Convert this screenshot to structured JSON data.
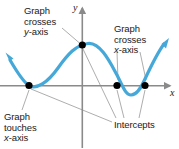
{
  "figure": {
    "colors": {
      "curve": "#45a8d8",
      "axis": "#8a8a8a",
      "leader": "#8a8a8a",
      "point": "#000000",
      "text": "#1a1a1a",
      "background": "#ffffff"
    },
    "axes": {
      "y_label": "y",
      "x_label": "x",
      "y_axis_x": 82,
      "x_axis_y": 86
    },
    "annotations": [
      {
        "id": "graph-crosses-y",
        "lines": [
          "Graph",
          "crosses",
          "y-axis"
        ],
        "line1": "Graph",
        "line2": "crosses",
        "line3_italic": "y",
        "line3_rest": "-axis",
        "target": "y-intercept"
      },
      {
        "id": "graph-crosses-x",
        "lines": [
          "Graph",
          "crosses",
          "x-axis"
        ],
        "line1": "Graph",
        "line2": "crosses",
        "line3_italic": "x",
        "line3_rest": "-axis",
        "target": "x-intercepts"
      },
      {
        "id": "graph-touches-x",
        "lines": [
          "Graph",
          "touches",
          "x-axis"
        ],
        "line1": "Graph",
        "line2": "touches",
        "line3_italic": "x",
        "line3_rest": "-axis",
        "target": "tangent-point"
      },
      {
        "id": "intercepts",
        "lines": [
          "Intercepts"
        ],
        "line1": "Intercepts",
        "target": "all-intercepts"
      }
    ],
    "points": [
      {
        "id": "tangent-x-intercept",
        "x": 29,
        "y": 85.5,
        "kind": "touches-x-axis"
      },
      {
        "id": "y-intercept",
        "x": 82,
        "y": 45,
        "kind": "crosses-y-axis"
      },
      {
        "id": "x-intercept-left",
        "x": 117,
        "y": 85.5,
        "kind": "crosses-x-axis"
      },
      {
        "id": "x-intercept-right",
        "x": 145,
        "y": 85.5,
        "kind": "crosses-x-axis"
      }
    ],
    "curve": {
      "description": "Quartic-like curve: arrow from upper-left, descends to touch x-axis at x=29, rises to local max near x=88 above the y-axis, descends crossing x-axis at x=117, reaches local min near x=131, rises crossing x-axis at x=145, exits upper-right with arrow",
      "arrow_start": "upper-left",
      "arrow_end": "upper-right"
    }
  }
}
